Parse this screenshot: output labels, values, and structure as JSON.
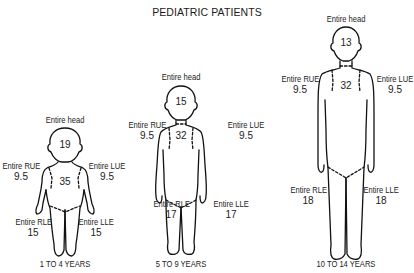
{
  "title": "PEDIATRIC PATIENTS",
  "figures": [
    {
      "age_label": "1 TO 4 YEARS",
      "head": {
        "label": "Entire head",
        "value": "19"
      },
      "trunk": {
        "value": "35"
      },
      "rue": {
        "label": "Entire RUE",
        "value": "9.5"
      },
      "lue": {
        "label": "Entire LUE",
        "value": "9.5"
      },
      "rle": {
        "label": "Entire RLE",
        "value": "15"
      },
      "lle": {
        "label": "Entire LLE",
        "value": "15"
      }
    },
    {
      "age_label": "5 TO 9 YEARS",
      "head": {
        "label": "Entire head",
        "value": "15"
      },
      "trunk": {
        "value": "32"
      },
      "rue": {
        "label": "Entire RUE",
        "value": "9.5"
      },
      "lue": {
        "label": "Entire LUE",
        "value": "9.5"
      },
      "rle": {
        "label": "Entire RLE",
        "value": "17"
      },
      "lle": {
        "label": "Entire LLE",
        "value": "17"
      }
    },
    {
      "age_label": "10 TO 14 YEARS",
      "head": {
        "label": "Entire head",
        "value": "13"
      },
      "trunk": {
        "value": "32"
      },
      "rue": {
        "label": "Entire RUE",
        "value": "9.5"
      },
      "lue": {
        "label": "Entire LUE",
        "value": "9.5"
      },
      "rle": {
        "label": "Entire RLE",
        "value": "18"
      },
      "lle": {
        "label": "Entire LLE",
        "value": "18"
      }
    }
  ]
}
